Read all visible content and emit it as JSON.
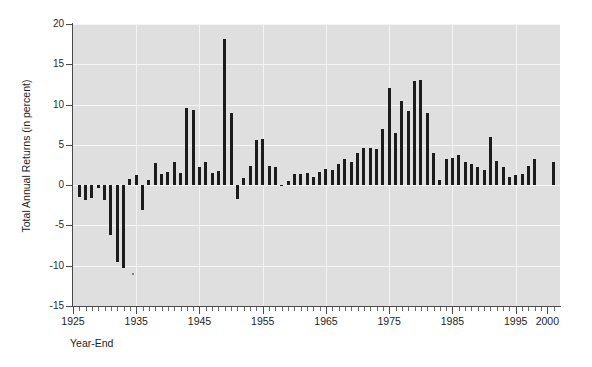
{
  "chart_data": {
    "type": "bar",
    "title": "",
    "subtitle": "",
    "xlabel": "Year-End",
    "ylabel": "Total Annual Returns (in percent)",
    "xlim": [
      1925,
      2002
    ],
    "ylim": [
      -15,
      20
    ],
    "grid": true,
    "legend": null,
    "y_ticks": [
      20,
      15,
      10,
      5,
      0,
      -5,
      -10,
      -15
    ],
    "x_ticks": [
      1925,
      1935,
      1945,
      1955,
      1965,
      1975,
      1985,
      1995,
      2000
    ],
    "x_minor_tick_interval": 1,
    "bar_color": "#1c1c1c",
    "plot_background": "#dfdfdf",
    "gridline_color": "#f4f4f4",
    "categories": [
      1926,
      1927,
      1928,
      1929,
      1930,
      1931,
      1932,
      1933,
      1934,
      1935,
      1936,
      1937,
      1938,
      1939,
      1940,
      1941,
      1942,
      1943,
      1944,
      1945,
      1946,
      1947,
      1948,
      1949,
      1950,
      1951,
      1952,
      1953,
      1954,
      1955,
      1956,
      1957,
      1958,
      1959,
      1960,
      1961,
      1962,
      1963,
      1964,
      1965,
      1966,
      1967,
      1968,
      1969,
      1970,
      1971,
      1972,
      1973,
      1974,
      1975,
      1976,
      1977,
      1978,
      1979,
      1980,
      1981,
      1982,
      1983,
      1984,
      1985,
      1986,
      1987,
      1988,
      1989,
      1990,
      1991,
      1992,
      1993,
      1994,
      1995,
      1996,
      1997,
      1998,
      1999,
      2000,
      2001
    ],
    "values": [
      -1.5,
      -1.9,
      -1.6,
      -0.4,
      -1.9,
      -6.2,
      -9.6,
      -10.3,
      0.8,
      1.3,
      -3.1,
      0.6,
      2.8,
      1.4,
      1.6,
      2.9,
      1.5,
      9.6,
      9.3,
      2.3,
      2.9,
      1.5,
      1.8,
      18.1,
      8.9,
      -1.7,
      0.9,
      2.4,
      5.6,
      5.7,
      2.4,
      2.3,
      -0.1,
      0.5,
      1.4,
      1.4,
      1.5,
      1.0,
      1.6,
      2.0,
      1.9,
      2.6,
      3.2,
      2.9,
      4.0,
      4.6,
      4.6,
      4.5,
      7.0,
      12.0,
      6.5,
      10.5,
      9.2,
      12.9,
      13.0,
      8.9,
      4.0,
      0.6,
      3.3,
      3.4,
      3.7,
      2.9,
      2.6,
      2.2,
      1.9,
      6.0,
      3.0,
      2.3,
      1.0,
      1.3,
      1.4,
      2.4,
      3.3,
      0.0,
      0.0,
      2.9
    ]
  }
}
